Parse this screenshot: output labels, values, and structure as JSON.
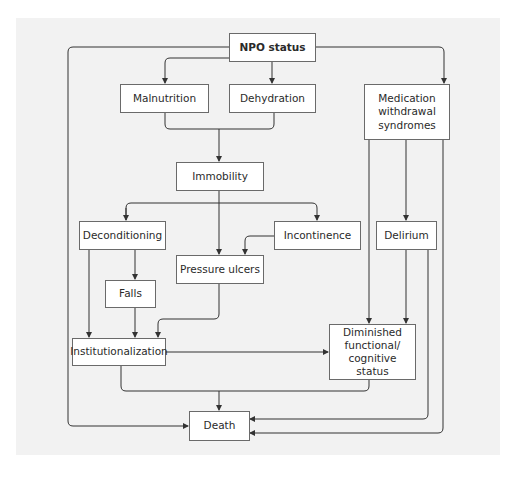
{
  "diagram": {
    "type": "flowchart",
    "colors": {
      "background_panel": "#f2f2f2",
      "node_fill": "#ffffff",
      "node_border": "#6a6a6a",
      "edge": "#333333",
      "text": "#2a2a2a"
    },
    "nodes": {
      "npo": {
        "label": "NPO status",
        "bold": true
      },
      "malnutrition": {
        "label": "Malnutrition"
      },
      "dehydration": {
        "label": "Dehydration"
      },
      "medication": {
        "label": "Medication\nwithdrawal\nsyndromes"
      },
      "immobility": {
        "label": "Immobility"
      },
      "deconditioning": {
        "label": "Deconditioning"
      },
      "incontinence": {
        "label": "Incontinence"
      },
      "delirium": {
        "label": "Delirium"
      },
      "pressure_ulcers": {
        "label": "Pressure ulcers"
      },
      "falls": {
        "label": "Falls"
      },
      "institutionalization": {
        "label": "Institutionalization"
      },
      "diminished": {
        "label": "Diminished\nfunctional/\ncognitive\nstatus"
      },
      "death": {
        "label": "Death"
      }
    },
    "edges": [
      {
        "from": "NPO status",
        "to": "Malnutrition"
      },
      {
        "from": "NPO status",
        "to": "Dehydration"
      },
      {
        "from": "NPO status",
        "to": "Medication withdrawal syndromes"
      },
      {
        "from": "NPO status",
        "to": "Death"
      },
      {
        "from": "Malnutrition + Dehydration",
        "to": "Immobility"
      },
      {
        "from": "Immobility",
        "to": "Deconditioning"
      },
      {
        "from": "Immobility",
        "to": "Incontinence"
      },
      {
        "from": "Immobility",
        "to": "Pressure ulcers"
      },
      {
        "from": "Incontinence",
        "to": "Pressure ulcers"
      },
      {
        "from": "Deconditioning",
        "to": "Falls"
      },
      {
        "from": "Deconditioning",
        "to": "Institutionalization"
      },
      {
        "from": "Falls",
        "to": "Institutionalization"
      },
      {
        "from": "Pressure ulcers",
        "to": "Institutionalization"
      },
      {
        "from": "Institutionalization",
        "to": "Diminished functional/cognitive status"
      },
      {
        "from": "Medication withdrawal syndromes",
        "to": "Delirium"
      },
      {
        "from": "Medication withdrawal syndromes",
        "to": "Diminished functional/cognitive status"
      },
      {
        "from": "Medication withdrawal syndromes",
        "to": "Death"
      },
      {
        "from": "Delirium",
        "to": "Diminished functional/cognitive status"
      },
      {
        "from": "Delirium",
        "to": "Death"
      },
      {
        "from": "Institutionalization + Diminished functional/cognitive status",
        "to": "Death"
      }
    ]
  }
}
